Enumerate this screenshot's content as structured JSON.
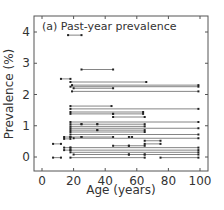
{
  "chart_data": {
    "type": "interval",
    "title": "(a) Past-year prevalence",
    "xlabel": "Age (years)",
    "ylabel": "Prevalence (%)",
    "xlim": [
      -5,
      105
    ],
    "ylim": [
      -0.45,
      4.5
    ],
    "xticks": [
      0,
      20,
      40,
      60,
      80,
      100
    ],
    "yticks": [
      0,
      1,
      2,
      3,
      4
    ],
    "grid": false,
    "legend": null,
    "intervals": [
      {
        "prevalence": 3.9,
        "age_from": 16.5,
        "age_to": 25
      },
      {
        "prevalence": 2.8,
        "age_from": 25,
        "age_to": 45
      },
      {
        "prevalence": 2.5,
        "age_from": 12,
        "age_to": 18
      },
      {
        "prevalence": 2.4,
        "age_from": 18,
        "age_to": 66
      },
      {
        "prevalence": 2.3,
        "age_from": 19,
        "age_to": 99
      },
      {
        "prevalence": 2.25,
        "age_from": 18,
        "age_to": 99
      },
      {
        "prevalence": 2.2,
        "age_from": 20,
        "age_to": 45
      },
      {
        "prevalence": 2.1,
        "age_from": 19,
        "age_to": 99
      },
      {
        "prevalence": 1.63,
        "age_from": 18,
        "age_to": 44
      },
      {
        "prevalence": 1.54,
        "age_from": 18,
        "age_to": 99
      },
      {
        "prevalence": 1.44,
        "age_from": 18,
        "age_to": 64
      },
      {
        "prevalence": 1.38,
        "age_from": 18,
        "age_to": 45
      },
      {
        "prevalence": 1.38,
        "age_from": 45,
        "age_to": 64
      },
      {
        "prevalence": 1.28,
        "age_from": 45,
        "age_to": 65
      },
      {
        "prevalence": 1.12,
        "age_from": 18,
        "age_to": 99
      },
      {
        "prevalence": 1.05,
        "age_from": 18,
        "age_to": 25
      },
      {
        "prevalence": 1.05,
        "age_from": 25,
        "age_to": 35
      },
      {
        "prevalence": 1.05,
        "age_from": 35,
        "age_to": 65
      },
      {
        "prevalence": 0.98,
        "age_from": 18,
        "age_to": 65
      },
      {
        "prevalence": 0.92,
        "age_from": 18,
        "age_to": 99
      },
      {
        "prevalence": 0.86,
        "age_from": 18,
        "age_to": 35
      },
      {
        "prevalence": 0.86,
        "age_from": 35,
        "age_to": 65
      },
      {
        "prevalence": 0.8,
        "age_from": 18,
        "age_to": 65
      },
      {
        "prevalence": 0.72,
        "age_from": 18,
        "age_to": 99
      },
      {
        "prevalence": 0.64,
        "age_from": 14,
        "age_to": 18
      },
      {
        "prevalence": 0.64,
        "age_from": 18,
        "age_to": 25
      },
      {
        "prevalence": 0.64,
        "age_from": 25,
        "age_to": 45
      },
      {
        "prevalence": 0.64,
        "age_from": 55,
        "age_to": 57
      },
      {
        "prevalence": 0.6,
        "age_from": 20,
        "age_to": 99
      },
      {
        "prevalence": 0.58,
        "age_from": 14,
        "age_to": 18
      },
      {
        "prevalence": 0.52,
        "age_from": 65,
        "age_to": 75
      },
      {
        "prevalence": 0.42,
        "age_from": 7,
        "age_to": 12
      },
      {
        "prevalence": 0.42,
        "age_from": 65,
        "age_to": 75
      },
      {
        "prevalence": 0.36,
        "age_from": 45,
        "age_to": 55
      },
      {
        "prevalence": 0.36,
        "age_from": 55,
        "age_to": 65
      },
      {
        "prevalence": 0.3,
        "age_from": 14,
        "age_to": 18
      },
      {
        "prevalence": 0.3,
        "age_from": 18,
        "age_to": 99
      },
      {
        "prevalence": 0.22,
        "age_from": 14,
        "age_to": 18
      },
      {
        "prevalence": 0.22,
        "age_from": 18,
        "age_to": 99
      },
      {
        "prevalence": 0.15,
        "age_from": 18,
        "age_to": 99
      },
      {
        "prevalence": 0.08,
        "age_from": 20,
        "age_to": 55
      },
      {
        "prevalence": 0.08,
        "age_from": 55,
        "age_to": 65
      },
      {
        "prevalence": 0.08,
        "age_from": 65,
        "age_to": 99
      },
      {
        "prevalence": -0.02,
        "age_from": 7,
        "age_to": 12
      },
      {
        "prevalence": -0.02,
        "age_from": 18,
        "age_to": 65
      },
      {
        "prevalence": -0.02,
        "age_from": 75,
        "age_to": 99
      }
    ]
  },
  "labels": {
    "title": "(a) Past-year prevalence",
    "xlabel": "Age (years)",
    "ylabel": "Prevalence (%)"
  }
}
